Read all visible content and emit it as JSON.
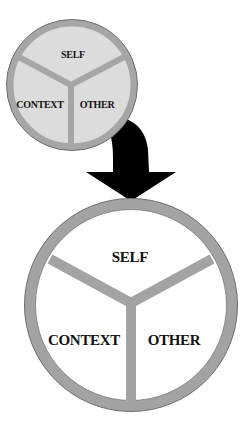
{
  "diagram": {
    "type": "transformation-diagram",
    "colors": {
      "background": "#ffffff",
      "small_fill": "#dcdcdc",
      "small_ring": "#a6a6a6",
      "large_fill": "#ffffff",
      "large_ring": "#a3a3a3",
      "ring_edge": "#6e6e6e",
      "arrow": "#000000",
      "text": "#111111"
    },
    "small_circle": {
      "labels": {
        "top": "SELF",
        "left": "CONTEXT",
        "right": "OTHER"
      }
    },
    "arrow": {
      "direction": "down",
      "meaning": "small circle transforms into large circle"
    },
    "large_circle": {
      "labels": {
        "top": "SELF",
        "left": "CONTEXT",
        "right": "OTHER"
      }
    }
  }
}
